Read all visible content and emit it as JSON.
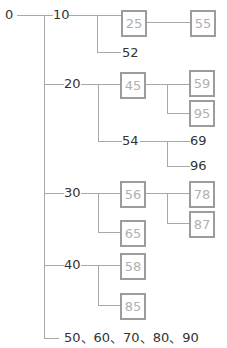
{
  "tree": {
    "root": "0",
    "branches": [
      {
        "label": "10",
        "children": [
          {
            "label": "25",
            "boxed": true,
            "children": [
              {
                "label": "55",
                "boxed": true
              }
            ]
          },
          {
            "label": "52",
            "boxed": false
          }
        ]
      },
      {
        "label": "20",
        "children": [
          {
            "label": "45",
            "boxed": true,
            "children": [
              {
                "label": "59",
                "boxed": true
              },
              {
                "label": "95",
                "boxed": true
              }
            ]
          },
          {
            "label": "54",
            "boxed": false,
            "children": [
              {
                "label": "69",
                "boxed": false
              },
              {
                "label": "96",
                "boxed": false
              }
            ]
          }
        ]
      },
      {
        "label": "30",
        "children": [
          {
            "label": "56",
            "boxed": true,
            "children": [
              {
                "label": "78",
                "boxed": true
              },
              {
                "label": "87",
                "boxed": true
              }
            ]
          },
          {
            "label": "65",
            "boxed": true
          }
        ]
      },
      {
        "label": "40",
        "children": [
          {
            "label": "58",
            "boxed": true
          },
          {
            "label": "85",
            "boxed": true
          }
        ]
      },
      {
        "label": "50、60、70、80、90"
      }
    ]
  },
  "colors": {
    "line": "#a8a8a8",
    "box_border": "#9c9c9c",
    "boxed_text": "#b0b0b0",
    "plain_text": "#333333"
  }
}
